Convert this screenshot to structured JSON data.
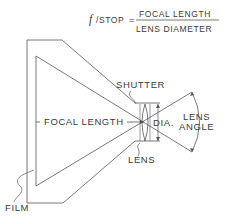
{
  "formula": {
    "lhs_italic": "f",
    "lhs_rest": "/STOP",
    "equals": "=",
    "numerator": "FOCAL LENGTH",
    "denominator": "LENS DIAMETER"
  },
  "labels": {
    "shutter": "SHUTTER",
    "focal_length": "FOCAL LENGTH",
    "dia": "DIA.",
    "lens_angle_line1": "LENS",
    "lens_angle_line2": "ANGLE",
    "lens": "LENS",
    "film": "FILM"
  },
  "colors": {
    "line": "#555555",
    "text": "#3a3a3a",
    "background": "#ffffff"
  }
}
